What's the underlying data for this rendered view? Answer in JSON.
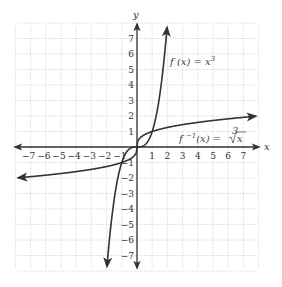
{
  "chart_data": {
    "type": "line",
    "title": "",
    "xlabel": "x",
    "ylabel": "y",
    "xlim": [
      -7.8,
      7.8
    ],
    "ylim": [
      -7.8,
      7.8
    ],
    "grid": true,
    "x_ticks": [
      -7,
      -6,
      -5,
      -4,
      -3,
      -2,
      -1,
      1,
      2,
      3,
      4,
      5,
      6,
      7
    ],
    "y_ticks": [
      -7,
      -6,
      -5,
      -4,
      -3,
      -2,
      -1,
      1,
      2,
      3,
      4,
      5,
      6,
      7
    ],
    "series": [
      {
        "name": "f(x) = x^3",
        "label": "f (x) = x³",
        "x": [
          -1.95,
          -1.75,
          -1.5,
          -1.25,
          -1,
          -0.5,
          0,
          0.5,
          1,
          1.25,
          1.5,
          1.75,
          1.95
        ],
        "y": [
          -7.41,
          -5.36,
          -3.375,
          -1.95,
          -1,
          -0.125,
          0,
          0.125,
          1,
          1.95,
          3.375,
          5.36,
          7.41
        ]
      },
      {
        "name": "f^-1(x) = cbrt(x)",
        "label": "f ⁻¹(x) = ∛x",
        "x": [
          -7.8,
          -6,
          -4,
          -2,
          -1,
          -0.5,
          -0.125,
          0,
          0.125,
          0.5,
          1,
          2,
          4,
          6,
          7.8
        ],
        "y": [
          -1.98,
          -1.817,
          -1.587,
          -1.26,
          -1,
          -0.794,
          -0.5,
          0,
          0.5,
          0.794,
          1,
          1.26,
          1.587,
          1.817,
          1.98
        ]
      }
    ],
    "annotations": [
      {
        "text": "f (x) = x³",
        "x": 2.5,
        "y": 5.6
      },
      {
        "text": "f ⁻¹(x) = ∛x",
        "x": 2.7,
        "y": 0.5
      }
    ]
  },
  "labels": {
    "x_axis": "x",
    "y_axis": "y",
    "f_label": "f (x) = x",
    "f_exp": "3",
    "finv_label": "f ",
    "finv_exp": "−1",
    "finv_rest": "(x) = ",
    "finv_root_index": "3",
    "finv_radicand": "x"
  },
  "ticks": {
    "x": [
      "−7",
      "−6",
      "−5",
      "−4",
      "−3",
      "−2",
      "−1",
      "1",
      "2",
      "3",
      "4",
      "5",
      "6",
      "7"
    ],
    "y_pos": [
      "7",
      "6",
      "5",
      "4",
      "3",
      "2",
      "1"
    ],
    "y_neg": [
      "−1",
      "−2",
      "−3",
      "−4",
      "−5",
      "−6",
      "−7"
    ]
  }
}
